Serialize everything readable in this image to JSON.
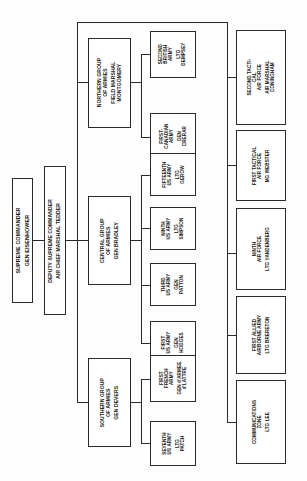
{
  "chart": {
    "type": "organization-chart",
    "orientation": "rotated-90-ccw",
    "nodes": {
      "supreme_commander": {
        "title": "SUPREME COMMANDER",
        "person": "GEN EISENHOWER"
      },
      "deputy_supreme_commander": {
        "title": "DEPUTY SUPREME COMMANDER",
        "person": "AIR CHIEF MARSHAL TEDDER"
      },
      "northern_group": {
        "title": "NORTHERN GROUP\nOF ARMIES",
        "title_line1": "NORTHERN GROUP",
        "title_line2": "OF ARMIES",
        "person_line1": "FIELD MARSHAL",
        "person_line2": "MONTGOMERY"
      },
      "central_group": {
        "title_line1": "CENTRAL GROUP",
        "title_line2": "OF ARMIES",
        "person": "GEN BRADLEY"
      },
      "southern_group": {
        "title_line1": "SOUTHERN GROUP",
        "title_line2": "OF ARMIES",
        "person": "GEN DEVERS"
      },
      "second_british_army": {
        "title_line1": "SECOND",
        "title_line2": "BRITISH",
        "title_line3": "ARMY",
        "person_line1": "LTG",
        "person_line2": "DEMPSEY"
      },
      "first_canadian_army": {
        "title_line1": "FIRST-",
        "title_line2": "CANADIAN",
        "title_line3": "ARMY",
        "person_line1": "GEN",
        "person_line2": "CRERAR"
      },
      "fifteenth_us_army": {
        "title_line1": "FIFTEENTH",
        "title_line2": "US ARMY",
        "person_line1": "LTG",
        "person_line2": "GEROW"
      },
      "ninth_us_army": {
        "title_line1": "NINTH",
        "title_line2": "US ARMY",
        "person_line1": "LTG",
        "person_line2": "SIMPSON"
      },
      "third_us_army": {
        "title_line1": "THIRD",
        "title_line2": "US ARMY",
        "person_line1": "GEN",
        "person_line2": "PATTON"
      },
      "first_us_army": {
        "title_line1": "FIRST",
        "title_line2": "US ARMY",
        "person_line1": "GEN",
        "person_line2": "HODGES"
      },
      "first_french_army": {
        "title_line1": "FIRST",
        "title_line2": "FRENCH",
        "title_line3": "ARMY",
        "person_line1": "GEN d'ARMEE",
        "person_line2": "d'LATTRE"
      },
      "seventh_us_army": {
        "title_line1": "SEVENTH",
        "title_line2": "US ARMY",
        "person_line1": "LTG",
        "person_line2": "PATCH"
      },
      "second_tactical_air_force": {
        "title_line1": "SECOND TACTI-",
        "title_line2": "CAL",
        "title_line3": "AIR FORCE",
        "person_line1": "AIR MARSHAL",
        "person_line2": "CONINGHAM"
      },
      "first_tactical_air_force": {
        "title_line1": "FIRST TACTICAL",
        "title_line2": "AIR FORCE",
        "person": "MG WEBSTER"
      },
      "ninth_air_force": {
        "title_line1": "NINTH",
        "title_line2": "AIR FORCE",
        "person": "LTG VANDENBERG"
      },
      "first_allied_airborne_army": {
        "title_line1": "FIRST ALLIED",
        "title_line2": "AIRBORNE ARMY",
        "person": "LTG BRERETON"
      },
      "communications_zone": {
        "title_line1": "COMMUNICATIONS",
        "title_line2": "ZONE",
        "person": "LTG LEE"
      }
    },
    "colors": {
      "line": "#2a2a2a",
      "box_border": "#2a2a2a",
      "box_fill": "#ffffff",
      "text": "#161616",
      "background": "#fdfdfd"
    }
  }
}
